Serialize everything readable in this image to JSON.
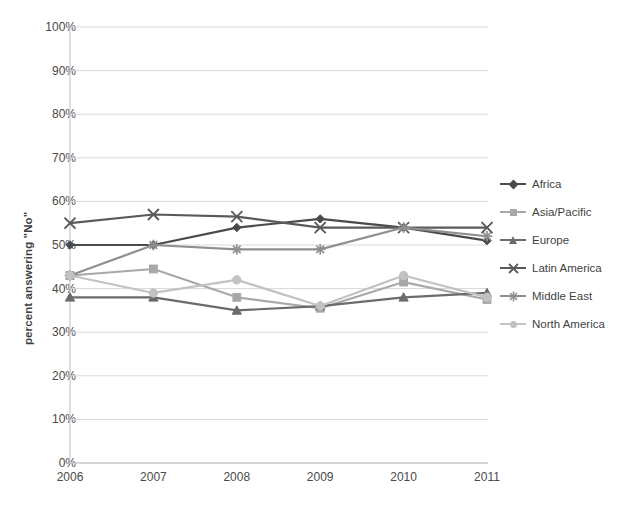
{
  "chart_data": {
    "type": "line",
    "title": "",
    "xlabel": "",
    "ylabel": "percent answering \"No\"",
    "categories": [
      "2006",
      "2007",
      "2008",
      "2009",
      "2010",
      "2011"
    ],
    "x": [
      2006,
      2007,
      2008,
      2009,
      2010,
      2011
    ],
    "ylim": [
      0,
      100
    ],
    "ytick_labels": [
      "0%",
      "10%",
      "20%",
      "30%",
      "40%",
      "50%",
      "60%",
      "70%",
      "80%",
      "90%",
      "100%"
    ],
    "ytick_values": [
      0,
      10,
      20,
      30,
      40,
      50,
      60,
      70,
      80,
      90,
      100
    ],
    "grid": true,
    "legend_position": "right",
    "value_suffix": "%",
    "series": [
      {
        "name": "Africa",
        "marker": "diamond",
        "color": "#4a4a4a",
        "values": [
          50,
          50,
          54,
          56,
          54,
          51
        ]
      },
      {
        "name": "Asia/Pacific",
        "marker": "square",
        "color": "#a8a8a8",
        "values": [
          43,
          44.5,
          38,
          35.5,
          41.5,
          37.5
        ]
      },
      {
        "name": "Europe",
        "marker": "triangle",
        "color": "#6b6b6b",
        "values": [
          38,
          38,
          35,
          36,
          38,
          39
        ]
      },
      {
        "name": "Latin America",
        "marker": "x",
        "color": "#5a5a5a",
        "values": [
          55,
          57,
          56.5,
          54,
          54,
          54
        ]
      },
      {
        "name": "Middle East",
        "marker": "asterisk",
        "color": "#8f8f8f",
        "values": [
          43,
          50,
          49,
          49,
          54,
          52
        ]
      },
      {
        "name": "North America",
        "marker": "circle",
        "color": "#c2c2c2",
        "values": [
          43,
          39,
          42,
          36,
          43,
          38
        ]
      }
    ]
  },
  "legend": {
    "items": [
      {
        "label": "Africa"
      },
      {
        "label": "Asia/Pacific"
      },
      {
        "label": "Europe"
      },
      {
        "label": "Latin America"
      },
      {
        "label": "Middle East"
      },
      {
        "label": "North America"
      }
    ]
  },
  "plot": {
    "left": 70,
    "right": 487,
    "top": 27,
    "bottom": 463
  },
  "colors": {
    "grid": "#d9d9d9",
    "axis": "#bfbfbf",
    "text": "#4a4a4a"
  }
}
